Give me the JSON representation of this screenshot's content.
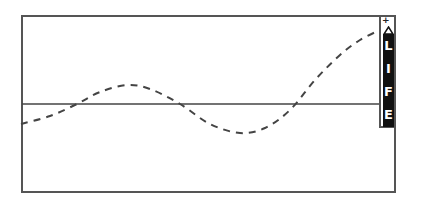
{
  "meter": {
    "label_letters": [
      "L",
      "I",
      "F",
      "E"
    ],
    "plus_symbol": "+",
    "arrow": "up-arrow"
  },
  "colors": {
    "frame": "#555555",
    "curve": "#444444",
    "bar": "#111111",
    "bar_text": "#ffffff"
  },
  "plot": {
    "baseline_y": 104,
    "curve_points": [
      [
        21,
        124
      ],
      [
        50,
        116
      ],
      [
        77,
        104
      ],
      [
        100,
        92
      ],
      [
        127,
        85
      ],
      [
        150,
        89
      ],
      [
        180,
        104
      ],
      [
        210,
        124
      ],
      [
        240,
        133
      ],
      [
        265,
        128
      ],
      [
        290,
        110
      ],
      [
        315,
        80
      ],
      [
        340,
        55
      ],
      [
        360,
        40
      ],
      [
        380,
        30
      ]
    ]
  }
}
